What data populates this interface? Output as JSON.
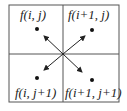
{
  "diagram": {
    "title": "",
    "cells": [
      {
        "label": "f(i, j)",
        "position": "top-left"
      },
      {
        "label": "f(i+1, j)",
        "position": "top-right"
      },
      {
        "label": "f(i, j+1)",
        "position": "bottom-left"
      },
      {
        "label": "f(i+1, j+1)",
        "position": "bottom-right"
      }
    ],
    "center_point": "arrows radiate from grid center toward each cell's dot",
    "colors": {
      "line": "#555555",
      "text": "#222222",
      "dot": "#111111"
    }
  }
}
